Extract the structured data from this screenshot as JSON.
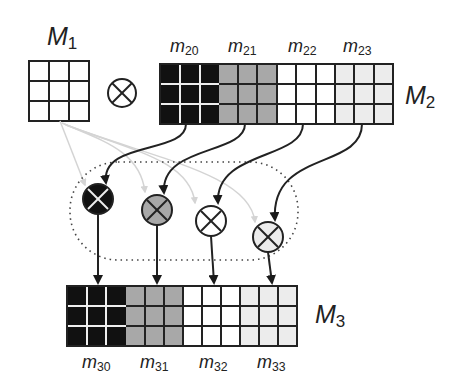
{
  "labels": {
    "m1": {
      "base": "M",
      "sub": "1"
    },
    "m2": {
      "base": "M",
      "sub": "2"
    },
    "m3": {
      "base": "M",
      "sub": "3"
    },
    "m2_blocks": [
      {
        "base": "m",
        "sub": "20"
      },
      {
        "base": "m",
        "sub": "21"
      },
      {
        "base": "m",
        "sub": "22"
      },
      {
        "base": "m",
        "sub": "23"
      }
    ],
    "m3_blocks": [
      {
        "base": "m",
        "sub": "30"
      },
      {
        "base": "m",
        "sub": "31"
      },
      {
        "base": "m",
        "sub": "32"
      },
      {
        "base": "m",
        "sub": "33"
      }
    ]
  },
  "operator_symbol": "circled-times",
  "block_colors": [
    "#111111",
    "#a8a8a8",
    "#ffffff",
    "#ececec"
  ],
  "colors": {
    "stroke": "#222222",
    "light_arrow": "#cfcfcf",
    "dotted_group": "#444444"
  }
}
